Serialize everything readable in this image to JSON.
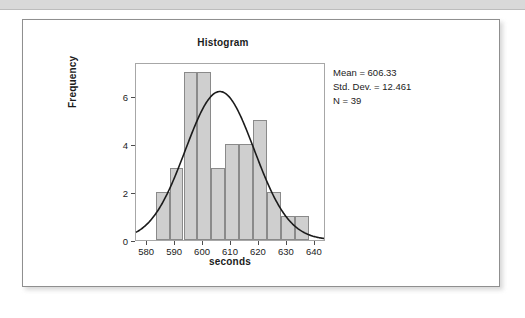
{
  "page": {
    "top_band_color": "#d9d9d9",
    "card_background": "#ffffff",
    "card_border_color": "#8f8f8f"
  },
  "chart_data": {
    "type": "bar",
    "title": "Histogram",
    "xlabel": "seconds",
    "ylabel": "Frequency",
    "categories": [
      "583",
      "588",
      "593",
      "598",
      "603",
      "608",
      "613",
      "618",
      "623",
      "628",
      "633"
    ],
    "bin_starts": [
      583,
      588,
      593,
      598,
      603,
      608,
      613,
      618,
      623,
      628,
      633
    ],
    "bin_width": 5,
    "values": [
      2,
      3,
      7,
      7,
      3,
      4,
      4,
      5,
      2,
      1,
      1
    ],
    "xlim": [
      576,
      644
    ],
    "ylim": [
      0,
      7.4
    ],
    "xticks": [
      580,
      590,
      600,
      610,
      620,
      630,
      640
    ],
    "xtick_labels": [
      "580",
      "590",
      "600",
      "610",
      "620",
      "630",
      "640"
    ],
    "yticks": [
      0,
      2,
      4,
      6
    ],
    "ytick_labels": [
      "0",
      "2",
      "4",
      "6"
    ],
    "grid": false,
    "legend": "none",
    "bar_fill_color": "#cfcfcf",
    "bar_border_color": "#8a8a8a",
    "curve_color": "#1b1b1b",
    "normal_curve": {
      "shown": true,
      "mean": 606.33,
      "std_dev": 12.461,
      "n": 39,
      "peak_value": 6.2
    },
    "annotations": {
      "mean_label": "Mean = 606.33",
      "std_dev_label": "Std. Dev. = 12.461",
      "n_label": "N = 39"
    }
  }
}
